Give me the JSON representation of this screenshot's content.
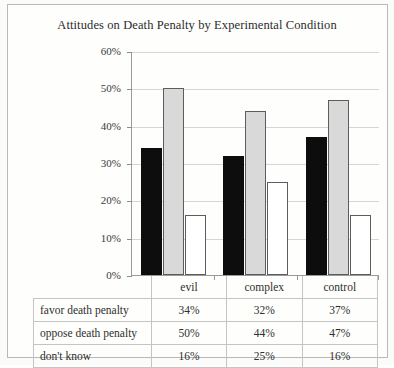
{
  "chart_data": {
    "type": "bar",
    "title": "Attitudes on Death Penalty by Experimental Condition",
    "xlabel": "",
    "ylabel": "",
    "ylim": [
      0,
      60
    ],
    "yticks": [
      "0%",
      "10%",
      "20%",
      "30%",
      "40%",
      "50%",
      "60%"
    ],
    "ytick_values": [
      0,
      10,
      20,
      30,
      40,
      50,
      60
    ],
    "grid": true,
    "legend": "none",
    "categories": [
      "evil",
      "complex",
      "control"
    ],
    "series": [
      {
        "name": "favor death penalty",
        "values": [
          34,
          50,
          16
        ]
      },
      {
        "name": "oppose death penalty",
        "values": [
          32,
          44,
          25
        ]
      },
      {
        "name": "don't know",
        "values": [
          37,
          47,
          16
        ]
      }
    ],
    "series_by_response": [
      {
        "name": "favor death penalty",
        "color": "#0d0d0d",
        "values": [
          34,
          32,
          37
        ],
        "labels": [
          "34%",
          "32%",
          "37%"
        ]
      },
      {
        "name": "oppose death penalty",
        "color": "#d9d9d9",
        "values": [
          50,
          44,
          47
        ],
        "labels": [
          "50%",
          "44%",
          "47%"
        ]
      },
      {
        "name": "don't know",
        "color": "#ffffff",
        "values": [
          16,
          25,
          16
        ],
        "labels": [
          "16%",
          "25%",
          "16%"
        ]
      }
    ]
  },
  "table": {
    "header": [
      "",
      "evil",
      "complex",
      "control"
    ],
    "rows": [
      {
        "label": "favor death penalty",
        "values": [
          "34%",
          "32%",
          "37%"
        ]
      },
      {
        "label": "oppose death penalty",
        "values": [
          "50%",
          "44%",
          "47%"
        ]
      },
      {
        "label": "don't know",
        "values": [
          "16%",
          "25%",
          "16%"
        ]
      }
    ]
  },
  "colors": {
    "favor": "#0d0d0d",
    "oppose": "#d9d9d9",
    "dont_know": "#ffffff",
    "grid": "#d6d6d6",
    "axis": "#9a9a9a",
    "frame": "#b9b9b9",
    "background": "#fbfbfa"
  }
}
